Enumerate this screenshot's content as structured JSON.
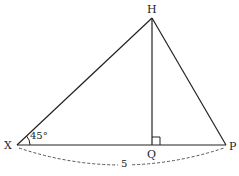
{
  "diagram": {
    "points": {
      "H": {
        "label": "H",
        "x": 152,
        "y": 18
      },
      "X": {
        "label": "X",
        "x": 17,
        "y": 145
      },
      "Q": {
        "label": "Q",
        "x": 152,
        "y": 145
      },
      "P": {
        "label": "P",
        "x": 226,
        "y": 145
      }
    },
    "angle_label": "45°",
    "base_length_label": "5",
    "right_angle_at": "Q",
    "line_color": "#222222",
    "dash_color": "#555555"
  }
}
